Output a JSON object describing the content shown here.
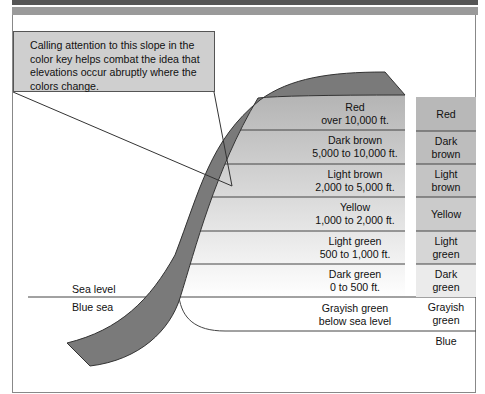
{
  "callout": {
    "text": "Calling attention to this slope in the color key helps combat the idea that elevations occur abruptly where the colors change."
  },
  "sea": {
    "sea_level_label": "Sea level",
    "blue_sea_label": "Blue sea"
  },
  "bands": [
    {
      "name": "Red",
      "range": "over 10,000 ft."
    },
    {
      "name": "Dark brown",
      "range": "5,000 to 10,000 ft."
    },
    {
      "name": "Light brown",
      "range": "2,000 to 5,000 ft."
    },
    {
      "name": "Yellow",
      "range": "1,000 to 2,000 ft."
    },
    {
      "name": "Light green",
      "range": "500 to 1,000 ft."
    },
    {
      "name": "Dark green",
      "range": "0 to 500 ft."
    },
    {
      "name": "Grayish green",
      "range": "below sea level"
    }
  ],
  "key": [
    {
      "line1": "Red",
      "line2": ""
    },
    {
      "line1": "Dark",
      "line2": "brown"
    },
    {
      "line1": "Light",
      "line2": "brown"
    },
    {
      "line1": "Yellow",
      "line2": ""
    },
    {
      "line1": "Light",
      "line2": "green"
    },
    {
      "line1": "Dark",
      "line2": "green"
    },
    {
      "line1": "Grayish",
      "line2": "green"
    },
    {
      "line1": "Blue",
      "line2": ""
    }
  ],
  "colors": {
    "slope_band": "#7a7a7a",
    "red_band": "#b4b4b4",
    "key_red": "#b8b8b8"
  }
}
